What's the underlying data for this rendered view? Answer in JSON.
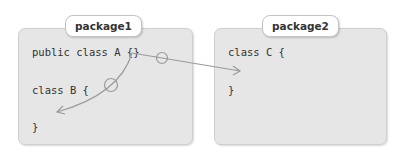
{
  "packages": [
    {
      "name": "package1",
      "lines": [
        "public class A {}",
        "class B {",
        "}"
      ]
    },
    {
      "name": "package2",
      "lines": [
        "class C {",
        "}"
      ]
    }
  ],
  "arrows": [
    {
      "from": "class A",
      "to": "class B",
      "marker": "circle",
      "color": "#9a9a9a"
    },
    {
      "from": "class A",
      "to": "class C",
      "marker": "circle",
      "color": "#9a9a9a"
    }
  ]
}
